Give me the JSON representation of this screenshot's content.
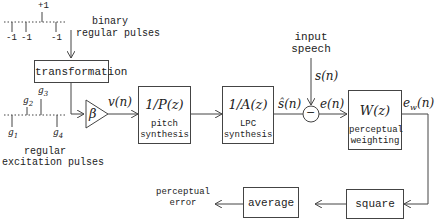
{
  "diagram": {
    "type": "block-diagram",
    "binary_pulses": {
      "label_line1": "binary",
      "label_line2": "regular pulses",
      "top_value": "+1",
      "bottom_values": [
        "-1",
        "-1",
        "-1"
      ]
    },
    "excitation_pulses": {
      "label_line1": "regular",
      "label_line2": "excitation pulses",
      "gains": [
        "g1",
        "g2",
        "g3",
        "g4"
      ],
      "gain_glyphs": [
        "g",
        "g",
        "g",
        "g"
      ],
      "gain_subs": [
        "1",
        "2",
        "3",
        "4"
      ]
    },
    "blocks": {
      "transformation": {
        "label": "transformation"
      },
      "gain": {
        "symbol": "β"
      },
      "pitch": {
        "formula": "1/P(z)",
        "sub1": "pitch",
        "sub2": "synthesis"
      },
      "lpc": {
        "formula": "1/A(z)",
        "sub1": "LPC",
        "sub2": "synthesis"
      },
      "summer": {
        "symbol": "−"
      },
      "weighting": {
        "formula": "W(z)",
        "sub1": "perceptual",
        "sub2": "weighting"
      },
      "square": {
        "label": "square"
      },
      "average": {
        "label": "average"
      }
    },
    "signals": {
      "v": "v(n)",
      "s_hat": "ŝ(n)",
      "s": "s(n)",
      "e": "e(n)",
      "ew_main": "e",
      "ew_sub": "w",
      "ew_tail": "(n)"
    },
    "input": {
      "line1": "input",
      "line2": "speech"
    },
    "output": {
      "line1": "perceptual",
      "line2": "error"
    },
    "colors": {
      "stroke": "#444444",
      "text": "#222222",
      "background": "#ffffff"
    }
  }
}
